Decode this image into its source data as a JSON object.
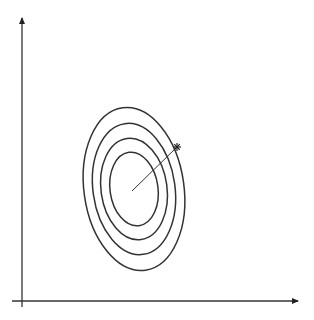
{
  "diagram": {
    "type": "contour-plot-gradient",
    "axes": {
      "x_axis": {
        "x1": 12,
        "y1": 301,
        "x2": 298,
        "y2": 301,
        "arrow": true
      },
      "y_axis": {
        "x1": 22,
        "y1": 307,
        "x2": 22,
        "y2": 18,
        "arrow": true
      }
    },
    "contours": {
      "center": [
        134,
        189
      ],
      "rotation_deg": -8,
      "ellipses": [
        {
          "rx": 24,
          "ry": 37
        },
        {
          "rx": 33,
          "ry": 51
        },
        {
          "rx": 41,
          "ry": 66
        },
        {
          "rx": 50,
          "ry": 82
        }
      ]
    },
    "vector": {
      "x1": 132,
      "y1": 191,
      "x2": 177,
      "y2": 147,
      "marker": "star"
    },
    "stroke_color": "#333333"
  }
}
